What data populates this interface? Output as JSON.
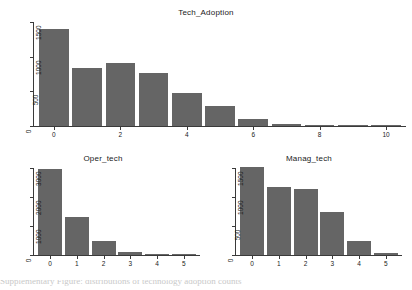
{
  "figure": {
    "background": "#ffffff",
    "bar_color": "#656565",
    "axis_color": "#3a3a3a",
    "text_color": "#1a1a1a",
    "footer_clipped_text": "Supplementary Figure: distributions of technology adoption counts"
  },
  "chart_data": [
    {
      "type": "bar",
      "title": "Tech_Adoption",
      "xlabel": "",
      "ylabel": "",
      "categories": [
        "0",
        "1",
        "2",
        "3",
        "4",
        "5",
        "6",
        "7",
        "8",
        "9",
        "10"
      ],
      "values": [
        1400,
        840,
        910,
        770,
        480,
        290,
        100,
        30,
        10,
        3,
        1
      ],
      "xticks": [
        "0",
        "2",
        "4",
        "6",
        "8",
        "10"
      ],
      "xtick_values": [
        0,
        2,
        4,
        6,
        8,
        10
      ],
      "yticks": [
        "0",
        "500",
        "1000",
        "1500"
      ],
      "ytick_values": [
        0,
        500,
        1000,
        1500
      ],
      "xlim": [
        -0.6,
        10.6
      ],
      "ylim": [
        0,
        1500
      ],
      "grid": false,
      "legend": null
    },
    {
      "type": "bar",
      "title": "Oper_tech",
      "xlabel": "",
      "ylabel": "",
      "categories": [
        "0",
        "1",
        "2",
        "3",
        "4",
        "5"
      ],
      "values": [
        2950,
        1300,
        500,
        110,
        30,
        5
      ],
      "xticks": [
        "0",
        "1",
        "2",
        "3",
        "4",
        "5"
      ],
      "xtick_values": [
        0,
        1,
        2,
        3,
        4,
        5
      ],
      "yticks": [
        "0",
        "1000",
        "2000",
        "3000"
      ],
      "ytick_values": [
        0,
        1000,
        2000,
        3000
      ],
      "xlim": [
        -0.6,
        5.6
      ],
      "ylim": [
        0,
        3000
      ],
      "grid": false,
      "legend": null
    },
    {
      "type": "bar",
      "title": "Manag_tech",
      "xlabel": "",
      "ylabel": "",
      "categories": [
        "0",
        "1",
        "2",
        "3",
        "4",
        "5"
      ],
      "values": [
        1520,
        1170,
        1140,
        740,
        250,
        30
      ],
      "xticks": [
        "0",
        "1",
        "2",
        "3",
        "4",
        "5"
      ],
      "xtick_values": [
        0,
        1,
        2,
        3,
        4,
        5
      ],
      "yticks": [
        "0",
        "500",
        "1000",
        "1500"
      ],
      "ytick_values": [
        0,
        500,
        1000,
        1500
      ],
      "xlim": [
        -0.6,
        5.6
      ],
      "ylim": [
        0,
        1500
      ],
      "grid": false,
      "legend": null
    }
  ]
}
